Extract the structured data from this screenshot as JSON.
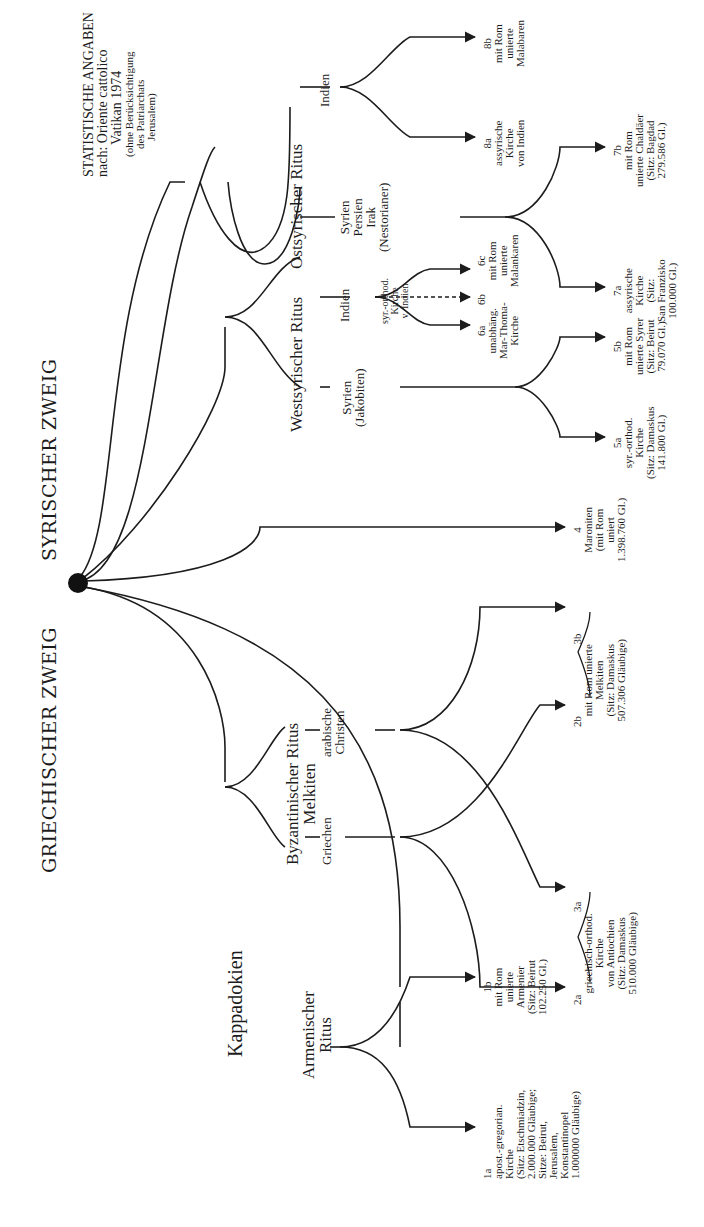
{
  "stats": {
    "title": "STATISTISCHE ANGABEN",
    "source": "nach: Oriente cattolico",
    "place_year": "Vatikan 1974",
    "note_1": "(ohne Berücksichtigung",
    "note_2": "des Patriarchats",
    "note_3": "Jerusalem)"
  },
  "branches": {
    "syrian": "SYRISCHER ZWEIG",
    "greek": "GRIECHISCHER ZWEIG"
  },
  "rites": {
    "east_syrian": "Ostsyrischer Ritus",
    "west_syrian": "Westsyrischer Ritus",
    "byzantine": "Byzantinischer Ritus\nMelkiten",
    "armenian": "Armenischer\nRitus",
    "cappadocia": "Kappadokien"
  },
  "regions": {
    "east_india": "Indien",
    "east_syria": "Syrien\nPersien\nIrak\n(Nestorianer)",
    "west_india": "Indien",
    "west_syria": "Syrien\n(Jakobiten)",
    "greeks": "Griechen",
    "arab_christians": "arabische\nChristen"
  },
  "leaves": {
    "8b": "8b\nmit Rom\nunierte\nMalabaren",
    "8a": "8a\nassyrische\nKirche\nvon Indien",
    "7b": "7b\nmit Rom\nunierte Chaldäer\n(Sitz: Bagdad\n279.586 Gl.)",
    "7a": "7a\nassyrische\nKirche\n(Sitz:\nSan Franzisko\n100.000 Gl.)",
    "6c": "6c\nmit Rom\nunierte\nMalankaren",
    "6b_label": "6b",
    "6b_text": "syr.-orthod.\nKirche\nv. Indien",
    "6a": "6a\nunabhäng.\nMar-Thoma-\nKirche",
    "5b": "5b\nmit Rom\nunierte Syrer\n(Sitz: Beirut\n79.070 Gl.)",
    "5a": "5a\nsyr.-orthod.\nKirche\n(Sitz: Damaskus\n141.800 Gl.)",
    "4": "4\nMaroniten\n(mit Rom\nuniert\n1.398.760 Gl.)",
    "2b_3b": "2b                          3b\nmit Rom unierte\nMelkiten\n(Sitz: Damaskus\n507.306 Gläubige)",
    "2a_3a": "2a                              3a\ngriechisch-orthod.\nKirche\nvon Antiochien\n(Sitz: Damaskus\n510.000 Gläubige)",
    "1b": "1b\nmit Rom\nunierte\nArmenier\n(Sitz: Beirut\n102.250 Gl.)",
    "1a": "1a\napost.-gregorian.\nKirche\n(Sitz: Etschmiadzin,\n2.000.000 Gläubige;\nSitze: Beirut,\nJerusalem,\nKonstantinopel\n1.000000 Gläubige)"
  },
  "colors": {
    "ink": "#1c1c1c",
    "background": "#ffffff"
  }
}
